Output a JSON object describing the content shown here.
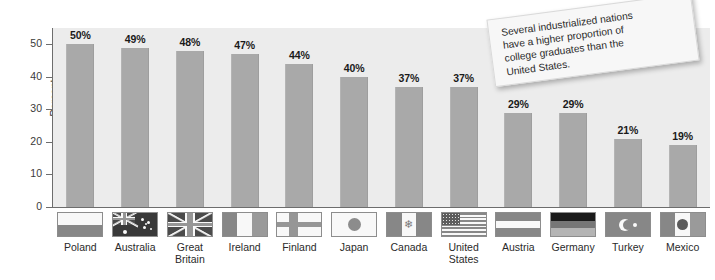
{
  "chart_data": {
    "type": "bar",
    "title": "",
    "xlabel": "",
    "ylabel": "Percent",
    "ylim": [
      0,
      55
    ],
    "yticks": [
      0,
      10,
      20,
      30,
      40,
      50
    ],
    "grid": false,
    "legend": "none",
    "value_suffix": "%",
    "categories": [
      "Poland",
      "Australia",
      "Great Britain",
      "Ireland",
      "Finland",
      "Japan",
      "Canada",
      "United States",
      "Austria",
      "Germany",
      "Turkey",
      "Mexico"
    ],
    "values": [
      50,
      49,
      48,
      47,
      44,
      40,
      37,
      37,
      29,
      29,
      21,
      19
    ],
    "value_labels": [
      "50%",
      "49%",
      "48%",
      "47%",
      "44%",
      "40%",
      "37%",
      "37%",
      "29%",
      "29%",
      "21%",
      "19%"
    ],
    "annotation": "Several industrialized nations have a higher proportion of college graduates than the United States."
  },
  "axis": {
    "ylabel": "Percent",
    "ticks": [
      "50",
      "40",
      "30",
      "20",
      "10",
      "0"
    ]
  },
  "note": {
    "line1": "Several industrialized nations",
    "line2": "have a higher proportion of",
    "line3": "college graduates than the",
    "line4": "United States."
  },
  "countries": [
    {
      "name": "Poland",
      "label_line1": "Poland",
      "label_line2": "",
      "value": "50%",
      "flag": "flag-poland"
    },
    {
      "name": "Australia",
      "label_line1": "Australia",
      "label_line2": "",
      "value": "49%",
      "flag": "flag-australia"
    },
    {
      "name": "Great Britain",
      "label_line1": "Great",
      "label_line2": "Britain",
      "value": "48%",
      "flag": "flag-great-britain"
    },
    {
      "name": "Ireland",
      "label_line1": "Ireland",
      "label_line2": "",
      "value": "47%",
      "flag": "flag-ireland"
    },
    {
      "name": "Finland",
      "label_line1": "Finland",
      "label_line2": "",
      "value": "44%",
      "flag": "flag-finland"
    },
    {
      "name": "Japan",
      "label_line1": "Japan",
      "label_line2": "",
      "value": "40%",
      "flag": "flag-japan"
    },
    {
      "name": "Canada",
      "label_line1": "Canada",
      "label_line2": "",
      "value": "37%",
      "flag": "flag-canada"
    },
    {
      "name": "United States",
      "label_line1": "United",
      "label_line2": "States",
      "value": "37%",
      "flag": "flag-united-states"
    },
    {
      "name": "Austria",
      "label_line1": "Austria",
      "label_line2": "",
      "value": "29%",
      "flag": "flag-austria"
    },
    {
      "name": "Germany",
      "label_line1": "Germany",
      "label_line2": "",
      "value": "29%",
      "flag": "flag-germany"
    },
    {
      "name": "Turkey",
      "label_line1": "Turkey",
      "label_line2": "",
      "value": "21%",
      "flag": "flag-turkey"
    },
    {
      "name": "Mexico",
      "label_line1": "Mexico",
      "label_line2": "",
      "value": "19%",
      "flag": "flag-mexico"
    }
  ],
  "colors": {
    "plot_background": "#ececec",
    "bar": "#a9a9a9",
    "axis": "#6d6d6d",
    "text": "#231f20",
    "note_background": "#f7f7f7"
  }
}
